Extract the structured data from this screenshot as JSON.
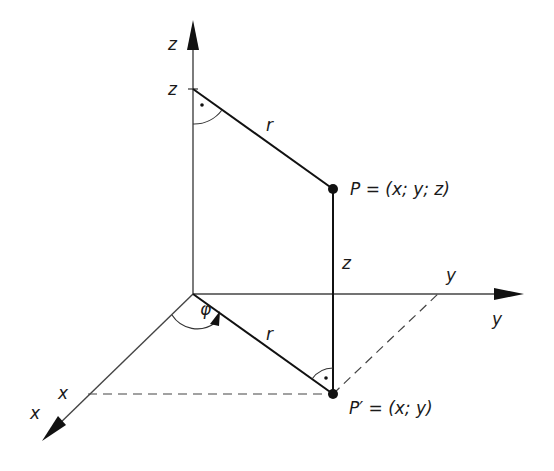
{
  "diagram": {
    "axes": {
      "z_axis_label": "z",
      "y_axis_label": "y",
      "x_axis_label": "x"
    },
    "ticks": {
      "z_tick": "z",
      "y_tick": "y",
      "x_tick": "x"
    },
    "segments": {
      "r_upper": "r",
      "r_lower": "r",
      "z_height": "z"
    },
    "angle": {
      "phi": "φ"
    },
    "points": {
      "P": "P = (x; y; z)",
      "P_prime": "P′ = (x; y)"
    },
    "colors": {
      "ink": "#1a1a1a",
      "background": "#ffffff"
    }
  }
}
